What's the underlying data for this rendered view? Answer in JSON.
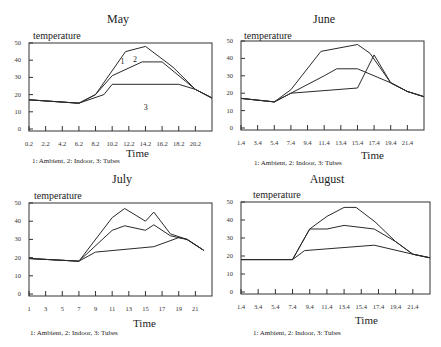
{
  "caption": "1: Ambient, 2: Indoor, 3: Tubes",
  "chart_data": [
    {
      "type": "line",
      "title": "May",
      "xlabel": "Time",
      "ylabel": "temperature",
      "ylim": [
        0,
        50
      ],
      "yticks": [
        0,
        10,
        20,
        30,
        40,
        50
      ],
      "xticks": [
        "0.2",
        "2.2",
        "4.2",
        "6.2",
        "8.2",
        "10.2",
        "12.2",
        "14.2",
        "16.2",
        "18.2",
        "20.2"
      ],
      "grid": false,
      "legend": "1: Ambient, 2: Indoor, 3: Tubes",
      "series_labels_on_plot": true,
      "series": [
        {
          "name": "1: Ambient",
          "x": [
            0.2,
            6.2,
            8.2,
            11.8,
            14.2,
            17.5,
            20.2,
            22.2
          ],
          "values": [
            17,
            15,
            20,
            45,
            48,
            36,
            23,
            18
          ]
        },
        {
          "name": "2: Indoor",
          "x": [
            0.2,
            6.2,
            8.2,
            10.2,
            13.8,
            16.2,
            20.2,
            22.2
          ],
          "values": [
            17,
            15,
            20,
            31,
            39,
            39,
            23,
            18
          ]
        },
        {
          "name": "3: Tubes",
          "x": [
            0.2,
            6.2,
            9.2,
            10.2,
            18.2,
            20.2,
            22.2
          ],
          "values": [
            17,
            15,
            20,
            26,
            26,
            23,
            18
          ]
        }
      ]
    },
    {
      "type": "line",
      "title": "June",
      "xlabel": "Time",
      "ylabel": "temperature",
      "ylim": [
        0,
        50
      ],
      "yticks": [
        0,
        10,
        20,
        30,
        40,
        50
      ],
      "xticks": [
        "1.4",
        "3.4",
        "5.4",
        "7.4",
        "9.4",
        "11.4",
        "13.4",
        "15.4",
        "17.4",
        "19.4",
        "21.4"
      ],
      "grid": false,
      "legend": "1: Ambient, 2: Indoor, 3: Tubes",
      "series": [
        {
          "name": "1: Ambient",
          "x": [
            1.4,
            5.4,
            7.4,
            11.0,
            15.4,
            16.9,
            19.4,
            21.4,
            23.4
          ],
          "values": [
            17,
            15,
            22,
            44,
            48,
            43,
            26,
            21,
            18
          ]
        },
        {
          "name": "2: Indoor",
          "x": [
            1.4,
            5.4,
            7.4,
            11.4,
            12.9,
            15.4,
            19.4,
            21.4,
            23.4
          ],
          "values": [
            17,
            15,
            20,
            30,
            34,
            34,
            26,
            21,
            18
          ]
        },
        {
          "name": "3: Tubes",
          "x": [
            1.4,
            5.4,
            7.4,
            15.4,
            17.4,
            19.4,
            21.4,
            23.4
          ],
          "values": [
            17,
            15,
            20,
            23,
            42,
            26,
            21,
            18
          ]
        }
      ]
    },
    {
      "type": "line",
      "title": "July",
      "xlabel": "Time",
      "ylabel": "temperature",
      "ylim": [
        0,
        50
      ],
      "yticks": [
        0,
        10,
        20,
        30,
        40,
        50
      ],
      "xticks": [
        "1",
        "3",
        "5",
        "7",
        "9",
        "11",
        "13",
        "15",
        "17",
        "19",
        "21"
      ],
      "grid": false,
      "legend": "1: Ambient, 2: Indoor, 3: Tubes",
      "series": [
        {
          "name": "1: Ambient",
          "x": [
            1,
            7,
            11,
            12.5,
            15,
            16,
            18,
            20,
            22
          ],
          "values": [
            19.5,
            18,
            42,
            47,
            40,
            45,
            33,
            30,
            24
          ]
        },
        {
          "name": "2: Indoor",
          "x": [
            1,
            7,
            11,
            12.5,
            15,
            16,
            18,
            20,
            22
          ],
          "values": [
            19.5,
            18,
            35,
            37.5,
            35,
            38,
            32,
            30,
            24
          ]
        },
        {
          "name": "3: Tubes",
          "x": [
            1,
            7,
            9,
            16,
            19,
            20,
            22
          ],
          "values": [
            19.5,
            18,
            23,
            26,
            31,
            30,
            24
          ]
        }
      ]
    },
    {
      "type": "line",
      "title": "August",
      "xlabel": "Time",
      "ylabel": "temperature",
      "ylim": [
        0,
        50
      ],
      "yticks": [
        0,
        10,
        20,
        30,
        40,
        50
      ],
      "xticks": [
        "1.4",
        "3.4",
        "5.4",
        "7.4",
        "9.4",
        "11.4",
        "13.4",
        "15.4",
        "17.4",
        "19.4",
        "21.4"
      ],
      "grid": false,
      "legend": "1: Ambient, 2: Indoor, 3: Tubes",
      "series": [
        {
          "name": "1: Ambient",
          "x": [
            1.4,
            7.4,
            9.4,
            11.4,
            13.4,
            14.8,
            17.0,
            19.4,
            21.4,
            23.4
          ],
          "values": [
            18,
            18,
            35,
            42,
            47,
            47,
            39,
            28,
            21,
            19
          ]
        },
        {
          "name": "2: Indoor",
          "x": [
            1.4,
            7.4,
            9.4,
            11.4,
            13.4,
            16.9,
            19.4,
            21.4,
            23.4
          ],
          "values": [
            18,
            18,
            35,
            35,
            37,
            35,
            28,
            21,
            19
          ]
        },
        {
          "name": "3: Tubes",
          "x": [
            1.4,
            7.4,
            8.8,
            16.9,
            21.4,
            23.4
          ],
          "values": [
            18,
            18,
            23,
            26,
            21,
            19
          ]
        }
      ]
    }
  ]
}
